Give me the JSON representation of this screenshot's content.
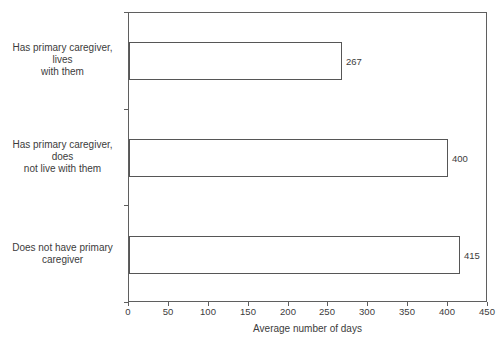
{
  "chart_data": {
    "type": "bar",
    "orientation": "horizontal",
    "title": "",
    "categories": [
      "Has primary caregiver, lives with them",
      "Has primary caregiver, does not live with them",
      "Does not have primary caregiver"
    ],
    "category_lines": [
      [
        "Has primary caregiver, lives",
        "with them"
      ],
      [
        "Has primary caregiver, does",
        "not live with them"
      ],
      [
        "Does not have primary",
        "caregiver"
      ]
    ],
    "values": [
      267,
      400,
      415
    ],
    "value_labels": [
      "267",
      "400",
      "415"
    ],
    "xlabel": "Average number of days",
    "ylabel": "",
    "xlim": [
      0,
      450
    ],
    "xticks": [
      0,
      50,
      100,
      150,
      200,
      250,
      300,
      350,
      400,
      450
    ],
    "grid": false,
    "legend": false,
    "bar_fill": "#ffffff",
    "bar_border_color": "#565656",
    "frame_color": "#5f5f5f",
    "text_color": "#3c3c3c",
    "background_color": "#ffffff"
  }
}
